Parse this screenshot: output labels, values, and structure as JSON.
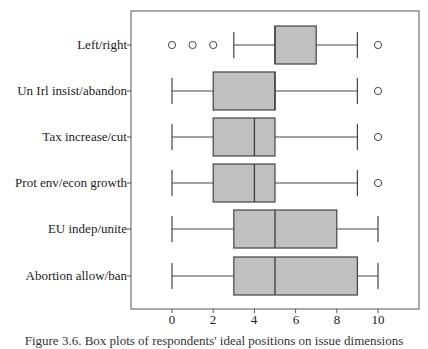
{
  "chart_data": {
    "type": "boxplot",
    "title": "",
    "xlabel": "",
    "ylabel": "",
    "xlim": [
      -2,
      12
    ],
    "xticks": [
      0,
      2,
      4,
      6,
      8,
      10
    ],
    "grid": false,
    "categories": [
      "Left/right",
      "Un Irl insist/abandon",
      "Tax increase/cut",
      "Prot env/econ growth",
      "EU indep/unite",
      "Abortion allow/ban"
    ],
    "series": [
      {
        "name": "Left/right",
        "whisker_low": 3,
        "q1": 5,
        "median": 5,
        "q3": 7,
        "whisker_high": 9,
        "outliers": [
          0,
          1,
          2,
          10
        ]
      },
      {
        "name": "Un Irl insist/abandon",
        "whisker_low": 0,
        "q1": 2,
        "median": 5,
        "q3": 5,
        "whisker_high": 9,
        "outliers": [
          10
        ]
      },
      {
        "name": "Tax increase/cut",
        "whisker_low": 0,
        "q1": 2,
        "median": 4,
        "q3": 5,
        "whisker_high": 9,
        "outliers": [
          10
        ]
      },
      {
        "name": "Prot env/econ growth",
        "whisker_low": 0,
        "q1": 2,
        "median": 4,
        "q3": 5,
        "whisker_high": 9,
        "outliers": [
          10
        ]
      },
      {
        "name": "EU indep/unite",
        "whisker_low": 0,
        "q1": 3,
        "median": 5,
        "q3": 8,
        "whisker_high": 10,
        "outliers": []
      },
      {
        "name": "Abortion allow/ban",
        "whisker_low": 0,
        "q1": 3,
        "median": 5,
        "q3": 9,
        "whisker_high": 10,
        "outliers": []
      }
    ],
    "box_fill": "#c0c0c0",
    "line_color": "#444444"
  },
  "labels": {
    "categories": [
      "Left/right",
      "Un Irl insist/abandon",
      "Tax increase/cut",
      "Prot env/econ growth",
      "EU indep/unite",
      "Abortion allow/ban"
    ],
    "ticks": [
      "0",
      "2",
      "4",
      "6",
      "8",
      "10"
    ]
  },
  "caption": "Figure 3.6. Box plots of respondents' ideal positions on issue dimensions"
}
